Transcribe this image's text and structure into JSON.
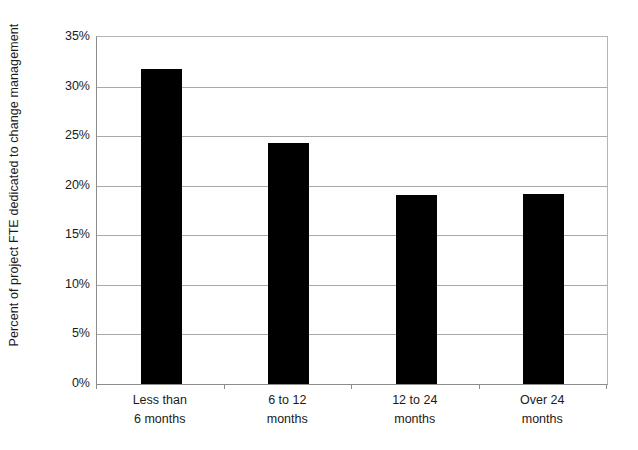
{
  "chart_data": {
    "type": "bar",
    "title": "",
    "subtitle": "",
    "xlabel": "",
    "ylabel": "Percent of project FTE dedicated to change management",
    "categories": [
      "Less than\n6 months",
      "6 to 12\nmonths",
      "12 to 24\nmonths",
      "Over 24\nmonths"
    ],
    "category_lines": [
      [
        "Less than",
        "6 months"
      ],
      [
        "6 to 12",
        "months"
      ],
      [
        "12 to 24",
        "months"
      ],
      [
        "Over 24",
        "months"
      ]
    ],
    "values": [
      31.8,
      24.3,
      19.1,
      19.2
    ],
    "value_labels": [
      "31.8%",
      "24.3%",
      "19.1%",
      "19.2%"
    ],
    "ylim": [
      0,
      35
    ],
    "yticks": [
      0,
      5,
      10,
      15,
      20,
      25,
      30,
      35
    ],
    "ytick_labels": [
      "0%",
      "5%",
      "10%",
      "15%",
      "20%",
      "25%",
      "30%",
      "35%"
    ],
    "grid": true,
    "grid_axis": "y",
    "legend": false,
    "legend_position": "none",
    "bar_color": "#000000",
    "grid_color": "#a9a9a9",
    "axis_color": "#8c8c8c",
    "background_color": "#ffffff",
    "text_color": "#1b1b1b"
  },
  "axis": {
    "y_title": "Percent of project FTE dedicated to change management"
  }
}
